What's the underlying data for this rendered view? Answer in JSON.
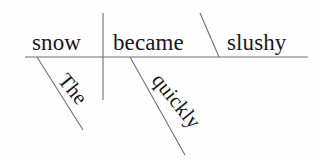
{
  "diagram": {
    "type": "reed-kellogg-sentence-diagram",
    "sentence": "The snow became slushy quickly.",
    "colors": {
      "background": "#fefefe",
      "ink": "#19181c",
      "rule": "#6f6f74"
    },
    "baseline": {
      "label": "horizontal-baseline",
      "x1": 25,
      "y1": 57,
      "x2": 308,
      "y2": 57
    },
    "subject_verb_divider": {
      "label": "subject-verb-divider",
      "x1": 103,
      "y1": 13,
      "x2": 103,
      "y2": 100
    },
    "predicate_slant": {
      "label": "predicate-adjective-slant",
      "x1": 200,
      "y1": 13,
      "x2": 219,
      "y2": 57
    },
    "words": {
      "subject": "snow",
      "verb": "became",
      "predicate_adjective": "slushy",
      "article": "The",
      "adverb": "quickly"
    },
    "modifier_lines": [
      {
        "label": "article-modifier-line",
        "word": "The",
        "attaches_to": "snow",
        "x1": 37,
        "y1": 57,
        "x2": 83,
        "y2": 130
      },
      {
        "label": "adverb-modifier-line",
        "word": "quickly",
        "attaches_to": "became",
        "x1": 130,
        "y1": 57,
        "x2": 185,
        "y2": 155
      }
    ]
  }
}
